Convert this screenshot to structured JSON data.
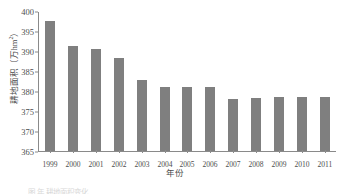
{
  "chart_data": {
    "type": "bar",
    "title": "",
    "xlabel": "年份",
    "ylabel": "耕地面积（万hm²）",
    "ylabel_main": "耕地面积（万hm",
    "ylabel_sup": "2",
    "ylabel_tail": "）",
    "categories": [
      "1999",
      "2000",
      "2001",
      "2002",
      "2003",
      "2004",
      "2005",
      "2006",
      "2007",
      "2008",
      "2009",
      "2010",
      "2011"
    ],
    "values": [
      397.7,
      391.4,
      390.8,
      388.4,
      383.0,
      381.2,
      381.1,
      381.1,
      378.2,
      378.4,
      378.5,
      378.6,
      378.5
    ],
    "ylim": [
      365,
      400
    ],
    "yticks": [
      "365",
      "370",
      "375",
      "380",
      "385",
      "390",
      "395",
      "400"
    ],
    "ytick_values": [
      365,
      370,
      375,
      380,
      385,
      390,
      395,
      400
    ],
    "grid": false,
    "legend": "none",
    "bar_color": "#7f7f7f",
    "axis_color": "#8a8a8a",
    "text_color": "#4d4d4d",
    "series": [
      {
        "name": "耕地面积",
        "values": [
          397.7,
          391.4,
          390.8,
          388.4,
          383.0,
          381.2,
          381.1,
          381.1,
          378.2,
          378.4,
          378.5,
          378.6,
          378.5
        ]
      }
    ]
  },
  "caption": {
    "text": "图    年    耕地面积变化"
  }
}
